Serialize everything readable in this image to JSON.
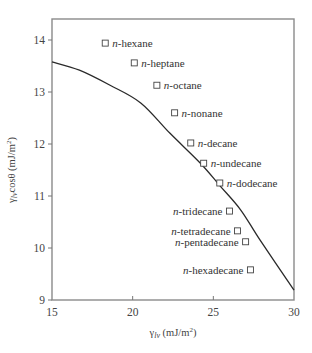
{
  "chart_data": {
    "type": "scatter",
    "title": "",
    "xlabel": "γlv (mJ/m²)",
    "ylabel": "γlv cosθ (mJ/m²)",
    "xlabel_parts": {
      "symbol": "γ",
      "sub": "lv",
      "unit": " (mJ/m",
      "sup": "2",
      "close": ")"
    },
    "ylabel_parts": {
      "symbol": "γ",
      "sub": "lv",
      "mid": "cosθ",
      "unit": " (mJ/m",
      "sup": "2",
      "close": ")"
    },
    "xlim": [
      15,
      30
    ],
    "ylim": [
      9,
      14.4
    ],
    "xticks": [
      15,
      20,
      25,
      30
    ],
    "yticks": [
      9,
      10,
      11,
      12,
      13,
      14
    ],
    "grid": false,
    "legend": "none (points labeled directly)",
    "series": [
      {
        "name": "n-alkanes",
        "marker": "open-square",
        "points": [
          {
            "label_prefix": "n",
            "label": "-hexane",
            "x": 18.3,
            "y": 13.94,
            "side": "right"
          },
          {
            "label_prefix": "n",
            "label": "-heptane",
            "x": 20.1,
            "y": 13.56,
            "side": "right"
          },
          {
            "label_prefix": "n",
            "label": "-octane",
            "x": 21.5,
            "y": 13.13,
            "side": "right"
          },
          {
            "label_prefix": "n",
            "label": "-nonane",
            "x": 22.6,
            "y": 12.6,
            "side": "right"
          },
          {
            "label_prefix": "n",
            "label": "-decane",
            "x": 23.6,
            "y": 12.02,
            "side": "right"
          },
          {
            "label_prefix": "n",
            "label": "-undecane",
            "x": 24.4,
            "y": 11.63,
            "side": "right"
          },
          {
            "label_prefix": "n",
            "label": "-dodecane",
            "x": 25.4,
            "y": 11.25,
            "side": "right"
          },
          {
            "label_prefix": "n",
            "label": "-tridecane",
            "x": 26.0,
            "y": 10.71,
            "side": "left"
          },
          {
            "label_prefix": "n",
            "label": "-tetradecane",
            "x": 26.5,
            "y": 10.33,
            "side": "left"
          },
          {
            "label_prefix": "n",
            "label": "-pentadecane",
            "x": 27.0,
            "y": 10.12,
            "side": "left"
          },
          {
            "label_prefix": "n",
            "label": "-hexadecane",
            "x": 27.3,
            "y": 9.58,
            "side": "left"
          }
        ]
      },
      {
        "name": "fitted curve",
        "style": "line",
        "x": [
          15.0,
          16.7,
          18.6,
          20.5,
          22.3,
          24.2,
          25.4,
          26.7,
          27.9,
          30.0
        ],
        "y": [
          13.58,
          13.42,
          13.13,
          12.79,
          12.21,
          11.63,
          11.2,
          10.73,
          10.15,
          9.19
        ]
      }
    ]
  }
}
